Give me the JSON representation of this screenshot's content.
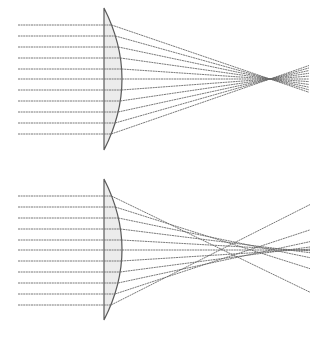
{
  "diagram": {
    "type": "optics-ray-diagram",
    "panels": [
      {
        "id": "top",
        "label": "",
        "description": "Plano-convex lens, ideal focusing (all rays meet at a single focal point)",
        "lens": {
          "flat_x": 104,
          "top_y": 8,
          "bottom_y": 150,
          "bulge_x": 122,
          "axis_y": 79
        },
        "ray_start_x": 18,
        "ray_end_x": 309,
        "ray_ys": [
          25,
          36,
          47,
          58,
          69,
          79,
          90,
          101,
          112,
          123,
          134
        ],
        "focus": {
          "x": 270,
          "y": 79
        },
        "aberration": 0
      },
      {
        "id": "bottom",
        "label": "",
        "description": "Plano-convex lens with spherical aberration (marginal rays focus closer than paraxial rays)",
        "lens": {
          "flat_x": 104,
          "top_y": 179,
          "bottom_y": 320,
          "bulge_x": 122,
          "axis_y": 250
        },
        "ray_start_x": 18,
        "ray_end_x": 310,
        "ray_ys": [
          196,
          207,
          218,
          229,
          240,
          250,
          261,
          272,
          283,
          294,
          305
        ],
        "focus": {
          "x": 300,
          "y": 250
        },
        "aberration": 80
      }
    ],
    "colors": {
      "ray": "#6a6a6a",
      "lens_fill": "#ececec",
      "lens_stroke": "#5a5a5a",
      "background": "#ffffff"
    }
  }
}
